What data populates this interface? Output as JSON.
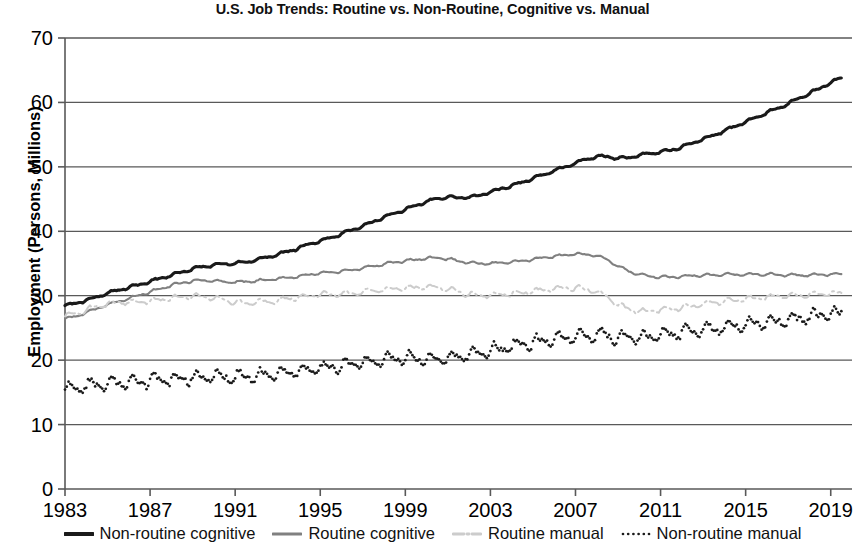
{
  "chart_data": {
    "type": "line",
    "title": "U.S. Job Trends: Routine vs. Non-Routine, Cognitive vs. Manual",
    "xlabel": "",
    "ylabel": "Employment (Persons, Millions)",
    "xlim": [
      1983,
      2020
    ],
    "ylim": [
      0,
      70
    ],
    "ytick_labels": [
      "0",
      "10",
      "20",
      "30",
      "40",
      "50",
      "60",
      "70"
    ],
    "yticks": [
      0,
      10,
      20,
      30,
      40,
      50,
      60,
      70
    ],
    "xtick_labels": [
      "1983",
      "1987",
      "1991",
      "1995",
      "1999",
      "2003",
      "2007",
      "2011",
      "2015",
      "2019"
    ],
    "xticks": [
      1983,
      1987,
      1991,
      1995,
      1999,
      2003,
      2007,
      2011,
      2015,
      2019
    ],
    "grid": "horizontal",
    "legend_position": "bottom",
    "series": [
      {
        "name": "Non-routine cognitive",
        "color": "#1a1a1a",
        "style": "solid",
        "width": 3.1,
        "x": [
          1983.0,
          1983.5,
          1984.0,
          1984.5,
          1985.0,
          1985.5,
          1986.0,
          1986.5,
          1987.0,
          1987.5,
          1988.0,
          1988.5,
          1989.0,
          1989.5,
          1990.0,
          1990.5,
          1991.0,
          1991.5,
          1992.0,
          1992.5,
          1993.0,
          1993.5,
          1994.0,
          1994.5,
          1995.0,
          1995.5,
          1996.0,
          1996.5,
          1997.0,
          1997.5,
          1998.0,
          1998.5,
          1999.0,
          1999.5,
          2000.0,
          2000.5,
          2001.0,
          2001.5,
          2002.0,
          2002.5,
          2003.0,
          2003.5,
          2004.0,
          2004.5,
          2005.0,
          2005.5,
          2006.0,
          2006.5,
          2007.0,
          2007.5,
          2008.0,
          2008.5,
          2009.0,
          2009.5,
          2010.0,
          2010.5,
          2011.0,
          2011.5,
          2012.0,
          2012.5,
          2013.0,
          2013.5,
          2014.0,
          2014.5,
          2015.0,
          2015.5,
          2016.0,
          2016.5,
          2017.0,
          2017.5,
          2018.0,
          2018.5,
          2019.0,
          2019.5
        ],
        "values": [
          28.5,
          28.8,
          29.3,
          29.8,
          30.4,
          30.9,
          31.3,
          31.7,
          32.2,
          32.7,
          33.2,
          33.7,
          34.2,
          34.5,
          34.8,
          34.9,
          35.0,
          35.2,
          35.6,
          36.0,
          36.4,
          36.9,
          37.4,
          38.0,
          38.5,
          39.0,
          39.6,
          40.2,
          40.8,
          41.5,
          42.2,
          42.8,
          43.4,
          44.0,
          44.6,
          45.1,
          45.3,
          45.2,
          45.3,
          45.6,
          46.1,
          46.6,
          47.1,
          47.6,
          48.2,
          48.8,
          49.4,
          50.0,
          50.6,
          51.2,
          51.6,
          51.6,
          51.3,
          51.4,
          51.8,
          52.1,
          52.3,
          52.6,
          53.1,
          53.7,
          54.3,
          54.9,
          55.6,
          56.3,
          57.0,
          57.7,
          58.4,
          59.1,
          59.8,
          60.6,
          61.4,
          62.2,
          63.1,
          63.8
        ]
      },
      {
        "name": "Routine cognitive",
        "color": "#808080",
        "style": "solid",
        "width": 2.1,
        "x": [
          1983.0,
          1983.5,
          1984.0,
          1984.5,
          1985.0,
          1985.5,
          1986.0,
          1986.5,
          1987.0,
          1987.5,
          1988.0,
          1988.5,
          1989.0,
          1989.5,
          1990.0,
          1990.5,
          1991.0,
          1991.5,
          1992.0,
          1992.5,
          1993.0,
          1993.5,
          1994.0,
          1994.5,
          1995.0,
          1995.5,
          1996.0,
          1996.5,
          1997.0,
          1997.5,
          1998.0,
          1998.5,
          1999.0,
          1999.5,
          2000.0,
          2000.5,
          2001.0,
          2001.5,
          2002.0,
          2002.5,
          2003.0,
          2003.5,
          2004.0,
          2004.5,
          2005.0,
          2005.5,
          2006.0,
          2006.5,
          2007.0,
          2007.5,
          2008.0,
          2008.5,
          2009.0,
          2009.5,
          2010.0,
          2010.5,
          2011.0,
          2011.5,
          2012.0,
          2012.5,
          2013.0,
          2013.5,
          2014.0,
          2014.5,
          2015.0,
          2015.5,
          2016.0,
          2016.5,
          2017.0,
          2017.5,
          2018.0,
          2018.5,
          2019.0,
          2019.5
        ],
        "values": [
          26.4,
          26.8,
          27.4,
          28.0,
          28.6,
          29.1,
          29.6,
          30.1,
          30.6,
          31.1,
          31.6,
          32.0,
          32.3,
          32.4,
          32.3,
          32.2,
          32.1,
          32.2,
          32.3,
          32.5,
          32.6,
          32.8,
          33.0,
          33.3,
          33.5,
          33.6,
          33.8,
          34.0,
          34.3,
          34.6,
          34.9,
          35.2,
          35.4,
          35.6,
          35.8,
          35.9,
          35.7,
          35.4,
          35.1,
          35.0,
          35.0,
          35.1,
          35.2,
          35.4,
          35.6,
          35.9,
          36.1,
          36.3,
          36.5,
          36.4,
          36.2,
          35.6,
          34.6,
          33.8,
          33.3,
          33.0,
          32.9,
          32.9,
          33.0,
          33.1,
          33.2,
          33.2,
          33.3,
          33.3,
          33.3,
          33.3,
          33.3,
          33.3,
          33.2,
          33.2,
          33.2,
          33.3,
          33.3,
          33.4
        ]
      },
      {
        "name": "Routine manual",
        "color": "#cccccc",
        "style": "dashdot",
        "width": 2.0,
        "x": [
          1983.0,
          1983.5,
          1984.0,
          1984.5,
          1985.0,
          1985.5,
          1986.0,
          1986.5,
          1987.0,
          1987.5,
          1988.0,
          1988.5,
          1989.0,
          1989.5,
          1990.0,
          1990.5,
          1991.0,
          1991.5,
          1992.0,
          1992.5,
          1993.0,
          1993.5,
          1994.0,
          1994.5,
          1995.0,
          1995.5,
          1996.0,
          1996.5,
          1997.0,
          1997.5,
          1998.0,
          1998.5,
          1999.0,
          1999.5,
          2000.0,
          2000.5,
          2001.0,
          2001.5,
          2002.0,
          2002.5,
          2003.0,
          2003.5,
          2004.0,
          2004.5,
          2005.0,
          2005.5,
          2006.0,
          2006.5,
          2007.0,
          2007.5,
          2008.0,
          2008.5,
          2009.0,
          2009.5,
          2010.0,
          2010.5,
          2011.0,
          2011.5,
          2012.0,
          2012.5,
          2013.0,
          2013.5,
          2014.0,
          2014.5,
          2015.0,
          2015.5,
          2016.0,
          2016.5,
          2017.0,
          2017.5,
          2018.0,
          2018.5,
          2019.0,
          2019.5
        ],
        "values": [
          26.8,
          27.2,
          27.8,
          28.3,
          28.7,
          28.9,
          29.0,
          29.1,
          29.2,
          29.4,
          29.6,
          29.8,
          29.9,
          29.8,
          29.6,
          29.3,
          29.0,
          28.9,
          29.0,
          29.1,
          29.3,
          29.5,
          29.8,
          30.0,
          30.2,
          30.2,
          30.3,
          30.4,
          30.6,
          30.8,
          31.0,
          31.1,
          31.2,
          31.3,
          31.4,
          31.3,
          31.0,
          30.6,
          30.2,
          30.1,
          30.1,
          30.2,
          30.3,
          30.5,
          30.7,
          30.9,
          31.1,
          31.2,
          31.2,
          31.0,
          30.6,
          29.8,
          28.6,
          27.9,
          27.6,
          27.6,
          27.8,
          28.0,
          28.2,
          28.4,
          28.7,
          28.9,
          29.1,
          29.3,
          29.5,
          29.7,
          29.8,
          29.9,
          30.0,
          30.1,
          30.2,
          30.3,
          30.4,
          30.5
        ]
      },
      {
        "name": "Non-routine manual",
        "color": "#1a1a1a",
        "style": "dotted",
        "width": 2.4,
        "x": [
          1983.0,
          1983.5,
          1984.0,
          1984.5,
          1985.0,
          1985.5,
          1986.0,
          1986.5,
          1987.0,
          1987.5,
          1988.0,
          1988.5,
          1989.0,
          1989.5,
          1990.0,
          1990.5,
          1991.0,
          1991.5,
          1992.0,
          1992.5,
          1993.0,
          1993.5,
          1994.0,
          1994.5,
          1995.0,
          1995.5,
          1996.0,
          1996.5,
          1997.0,
          1997.5,
          1998.0,
          1998.5,
          1999.0,
          1999.5,
          2000.0,
          2000.5,
          2001.0,
          2001.5,
          2002.0,
          2002.5,
          2003.0,
          2003.5,
          2004.0,
          2004.5,
          2005.0,
          2005.5,
          2006.0,
          2006.5,
          2007.0,
          2007.5,
          2008.0,
          2008.5,
          2009.0,
          2009.5,
          2010.0,
          2010.5,
          2011.0,
          2011.5,
          2012.0,
          2012.5,
          2013.0,
          2013.5,
          2014.0,
          2014.5,
          2015.0,
          2015.5,
          2016.0,
          2016.5,
          2017.0,
          2017.5,
          2018.0,
          2018.5,
          2019.0,
          2019.5
        ],
        "values": [
          15.4,
          15.7,
          16.0,
          16.2,
          16.4,
          16.5,
          16.6,
          16.7,
          16.8,
          16.9,
          17.0,
          17.2,
          17.3,
          17.4,
          17.4,
          17.4,
          17.4,
          17.5,
          17.6,
          17.8,
          18.0,
          18.2,
          18.4,
          18.6,
          18.8,
          19.0,
          19.2,
          19.4,
          19.6,
          19.8,
          20.0,
          20.2,
          20.3,
          20.3,
          20.3,
          20.3,
          20.4,
          20.6,
          20.9,
          21.2,
          21.5,
          21.8,
          22.1,
          22.4,
          22.7,
          23.0,
          23.3,
          23.5,
          23.7,
          23.8,
          23.9,
          23.8,
          23.5,
          23.4,
          23.5,
          23.7,
          23.9,
          24.1,
          24.3,
          24.5,
          24.7,
          24.9,
          25.1,
          25.3,
          25.5,
          25.7,
          25.9,
          26.1,
          26.3,
          26.5,
          26.7,
          26.9,
          27.1,
          27.3
        ]
      }
    ],
    "seasonal_noise": {
      "Non-routine cognitive": 0.17,
      "Routine cognitive": 0.16,
      "Routine manual": 0.33,
      "Non-routine manual": 0.78
    }
  },
  "legend": {
    "items": [
      {
        "label": "Non-routine cognitive",
        "icon": "solid-line-swatch"
      },
      {
        "label": "Routine cognitive",
        "icon": "solid-line-swatch"
      },
      {
        "label": "Routine manual",
        "icon": "dashdot-line-swatch"
      },
      {
        "label": "Non-routine manual",
        "icon": "dotted-line-swatch"
      }
    ]
  }
}
